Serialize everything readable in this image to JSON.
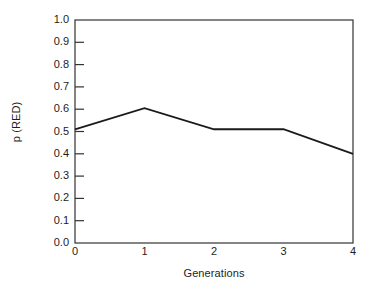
{
  "chart_data": {
    "type": "line",
    "title": "",
    "xlabel": "Generations",
    "ylabel": "p (RED)",
    "x": [
      0,
      1,
      2,
      3,
      4
    ],
    "values": [
      0.51,
      0.605,
      0.51,
      0.51,
      0.4
    ],
    "categories": [
      "0",
      "1",
      "2",
      "3",
      "4"
    ],
    "xlim": [
      0,
      4
    ],
    "ylim": [
      0.0,
      1.0
    ],
    "x_tick_labels": [
      "0",
      "1",
      "2",
      "3",
      "4"
    ],
    "y_tick_labels": [
      "1.0",
      "0.9",
      "0.8",
      "0.7",
      "0.6",
      "0.5",
      "0.4",
      "0.3",
      "0.2",
      "0.1",
      "0.0"
    ],
    "y_tick_values": [
      1.0,
      0.9,
      0.8,
      0.7,
      0.6,
      0.5,
      0.4,
      0.3,
      0.2,
      0.1,
      0.0
    ],
    "grid": false,
    "legend": null,
    "series_color": "#1a1a1a",
    "axis_color": "#333333",
    "background": "#ffffff"
  }
}
